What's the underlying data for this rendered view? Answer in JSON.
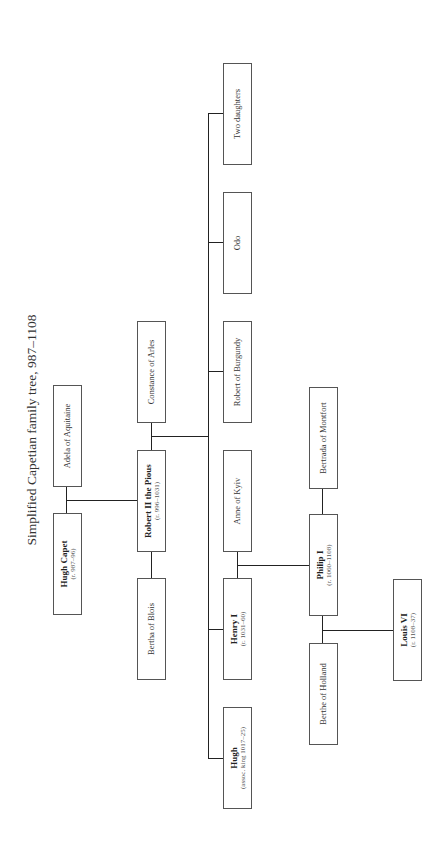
{
  "title": "Simplified Capetian family tree, 987–1108",
  "people": {
    "hugh_capet": {
      "name": "Hugh Capet",
      "reign": "(r. 987–96)"
    },
    "adela": {
      "name": "Adela of Aquitaine"
    },
    "robert_ii": {
      "name": "Robert II the Pious",
      "reign": "(r. 996–1031)"
    },
    "constance": {
      "name": "Constance of Arles"
    },
    "bertha": {
      "name": "Bertha of Blois"
    },
    "two_daughters": {
      "name": "Two daughters"
    },
    "odo": {
      "name": "Odo"
    },
    "robert_burgundy": {
      "name": "Robert of Burgundy"
    },
    "anne": {
      "name": "Anne of Kyiv"
    },
    "henry_i": {
      "name": "Henry I",
      "reign": "(r. 1031–60)"
    },
    "hugh": {
      "name": "Hugh",
      "reign": "(assoc. king 1017–25)"
    },
    "philip_i": {
      "name": "Philip I",
      "reign": "(r. 1060–1108)"
    },
    "bertrada": {
      "name": "Bertrada of Montfort"
    },
    "berthe": {
      "name": "Berthe of Holland"
    },
    "louis_vi": {
      "name": "Louis VI",
      "reign": "(r. 1108–37)"
    }
  },
  "relationships": [
    {
      "type": "marriage",
      "a": "Hugh Capet",
      "b": "Adela of Aquitaine",
      "children": [
        "Robert II the Pious"
      ]
    },
    {
      "type": "marriage",
      "a": "Robert II the Pious",
      "b": "Bertha of Blois",
      "children": []
    },
    {
      "type": "marriage",
      "a": "Robert II the Pious",
      "b": "Constance of Arles",
      "children": [
        "Hugh",
        "Henry I",
        "Robert of Burgundy",
        "Odo",
        "Two daughters"
      ]
    },
    {
      "type": "marriage",
      "a": "Henry I",
      "b": "Anne of Kyiv",
      "children": [
        "Philip I"
      ]
    },
    {
      "type": "marriage",
      "a": "Philip I",
      "b": "Bertrada of Montfort",
      "children": []
    },
    {
      "type": "marriage",
      "a": "Philip I",
      "b": "Berthe of Holland",
      "children": [
        "Louis VI"
      ]
    }
  ],
  "colors": {
    "line": "#222222",
    "box_border": "#555555",
    "background": "#ffffff"
  }
}
